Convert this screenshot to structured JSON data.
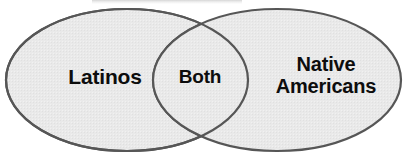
{
  "figure": {
    "type": "venn-2-set",
    "canvas": {
      "width": 408,
      "height": 160
    },
    "background_color": "#ffffff"
  },
  "style": {
    "set_fill_color": "#e9e9e9",
    "set_stroke_color": "#565656",
    "set_stroke_width": 2.2,
    "label_color": "#0d0d0d"
  },
  "sets": [
    {
      "id": "left-set",
      "label": "Latinos",
      "label_name": "latinos-label",
      "cx": 127,
      "cy": 80,
      "rx": 121,
      "ry": 71
    },
    {
      "id": "right-set",
      "label": "Native\nAmericans",
      "label_name": "native-americans-label",
      "cx": 277,
      "cy": 80,
      "rx": 124,
      "ry": 71
    }
  ],
  "intersection": {
    "id": "intersection-set",
    "label": "Both",
    "label_name": "both-label",
    "top_vertex": {
      "x": 200,
      "y": 18
    },
    "bottom_vertex": {
      "x": 200,
      "y": 142
    }
  },
  "artifacts": {
    "top_clipped_text_remnant": true
  }
}
